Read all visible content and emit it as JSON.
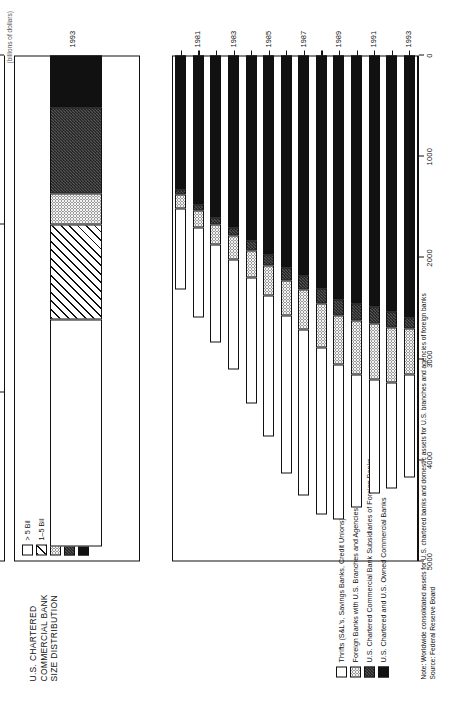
{
  "figure": {
    "unit_label": "(billions of dollars)",
    "note_line1": "Note: Worldwide consolidated assets for U.S. chartered banks and domestic assets for U.S. branches and agencies of foreign banks",
    "note_line2": "Source: Federal Reserve Board"
  },
  "inset": {
    "title": "U.S. CHARTERED\nCOMMERCIAL BANK\nSIZE DISTRIBUTION",
    "legend": [
      {
        "label": "> 5 Bil",
        "fill": "f-white"
      },
      {
        "label": "1–5 Bil",
        "fill": "f-diag"
      },
      {
        "label": ".5–1 Bil",
        "fill": "f-dots"
      },
      {
        "label": "100–500 Mil",
        "fill": "f-check"
      },
      {
        "label": "< 100 Mil",
        "fill": "f-black"
      }
    ],
    "ticks": [
      "3000",
      "2000",
      "1000",
      "0"
    ],
    "category": "1993"
  },
  "main": {
    "ticks": [
      "5000",
      "4000",
      "3000",
      "2000",
      "1000",
      "0"
    ],
    "legend": [
      {
        "label": "Thrifts (S&L's, Savings Banks, Credit Unions)",
        "fill": "f-white"
      },
      {
        "label": "Foreign Banks with U.S. Branches and Agencies",
        "fill": "f-dots"
      },
      {
        "label": "U.S. Chartered Commercial Bank Subsidiaries of Foreign Banks",
        "fill": "f-check"
      },
      {
        "label": "U.S. Chartered and U.S. Owned Commercial Banks",
        "fill": "f-black"
      }
    ],
    "year_ticks": [
      "1981",
      "1983",
      "1985",
      "1987",
      "1989",
      "1991",
      "1993"
    ]
  },
  "chart_data": [
    {
      "type": "bar",
      "id": "main-stacked-bar",
      "orientation": "horizontal",
      "title": "U.S. Financial Intermediary Assets",
      "xlabel": "",
      "ylabel": "",
      "unit": "billions of dollars",
      "xlim": [
        0,
        5600
      ],
      "grid": false,
      "legend_position": "left",
      "categories": [
        "1980",
        "1981",
        "1982",
        "1983",
        "1984",
        "1985",
        "1986",
        "1987",
        "1988",
        "1989",
        "1990",
        "1991",
        "1992",
        "1993"
      ],
      "series": [
        {
          "name": "U.S. Chartered and U.S. Owned Commercial Banks",
          "fill": "f-black",
          "values": [
            1480,
            1650,
            1790,
            1900,
            2050,
            2200,
            2350,
            2440,
            2580,
            2700,
            2750,
            2780,
            2830,
            2900
          ]
        },
        {
          "name": "U.S. Chartered Commercial Bank Subsidiaries of Foreign Banks",
          "fill": "f-check",
          "values": [
            60,
            70,
            85,
            95,
            105,
            120,
            140,
            155,
            165,
            175,
            180,
            185,
            175,
            125
          ]
        },
        {
          "name": "Foreign Banks with U.S. Branches and Agencies",
          "fill": "f-dots",
          "values": [
            150,
            180,
            220,
            260,
            300,
            340,
            390,
            440,
            490,
            540,
            600,
            620,
            610,
            510
          ]
        },
        {
          "name": "Thrifts (S&L's, Savings Banks, Credit Unions)",
          "fill": "f-white",
          "values": [
            900,
            1000,
            1080,
            1220,
            1400,
            1560,
            1750,
            1830,
            1840,
            1720,
            1470,
            1260,
            1180,
            1140
          ]
        }
      ],
      "totals": [
        2590,
        2900,
        3175,
        3475,
        3855,
        4220,
        4630,
        4865,
        5075,
        5135,
        5000,
        4845,
        4795,
        4675
      ],
      "tick_labels": [
        "0",
        "1000",
        "2000",
        "3000",
        "4000",
        "5000"
      ]
    },
    {
      "type": "bar",
      "id": "inset-size-distribution",
      "orientation": "horizontal",
      "title": "U.S. CHARTERED COMMERCIAL BANK SIZE DISTRIBUTION",
      "unit": "billions of dollars",
      "xlim": [
        0,
        3300
      ],
      "grid": false,
      "legend_position": "left",
      "categories": [
        "1993"
      ],
      "series": [
        {
          "name": "< 100 Mil",
          "fill": "f-black",
          "values": [
            340
          ]
        },
        {
          "name": "100–500 Mil",
          "fill": "f-check",
          "values": [
            560
          ]
        },
        {
          "name": ".5–1 Bil",
          "fill": "f-dots",
          "values": [
            200
          ]
        },
        {
          "name": "1–5 Bil",
          "fill": "f-diag",
          "values": [
            620
          ]
        },
        {
          "name": "> 5 Bil",
          "fill": "f-white",
          "values": [
            1480
          ]
        }
      ],
      "totals": [
        3200
      ],
      "tick_labels": [
        "0",
        "1000",
        "2000",
        "3000"
      ]
    }
  ]
}
